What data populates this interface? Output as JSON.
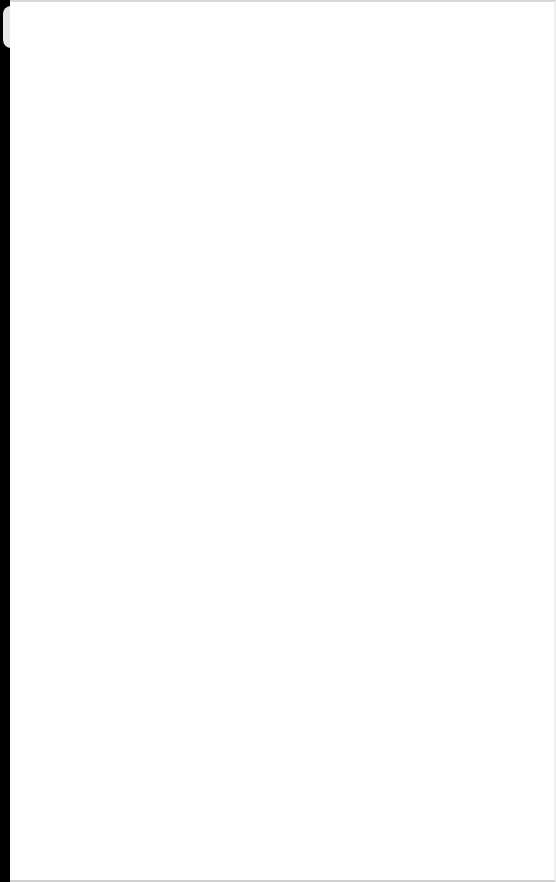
{
  "window": {
    "background_color": "#ffffff",
    "left_edge_color": "#000000",
    "tab_handle_color": "#e6e6e6",
    "content": []
  }
}
